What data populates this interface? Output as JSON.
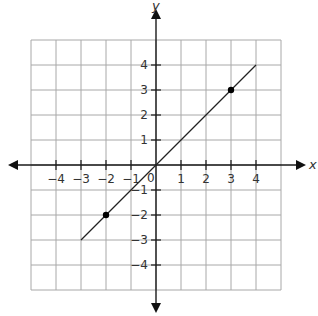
{
  "chart_data": {
    "type": "line",
    "title": "",
    "xlabel": "x",
    "ylabel": "y",
    "xlim": [
      -5,
      5
    ],
    "ylim": [
      -5,
      5
    ],
    "grid": true,
    "x_ticks": [
      -4,
      -3,
      -2,
      -1,
      1,
      2,
      3,
      4
    ],
    "y_ticks": [
      4,
      3,
      2,
      1,
      -1,
      -2,
      -3,
      -4
    ],
    "x_tick_labels": [
      "−4",
      "−3",
      "−2",
      "−1",
      "1",
      "2",
      "3",
      "4"
    ],
    "y_tick_labels": [
      "4",
      "3",
      "2",
      "1",
      "−1",
      "−2",
      "−3",
      "−4"
    ],
    "origin_label": "0",
    "series": [
      {
        "name": "y = x",
        "x": [
          -3,
          4
        ],
        "y": [
          -3,
          4
        ]
      }
    ],
    "points": [
      {
        "x": -2,
        "y": -2
      },
      {
        "x": 3,
        "y": 3
      }
    ]
  }
}
